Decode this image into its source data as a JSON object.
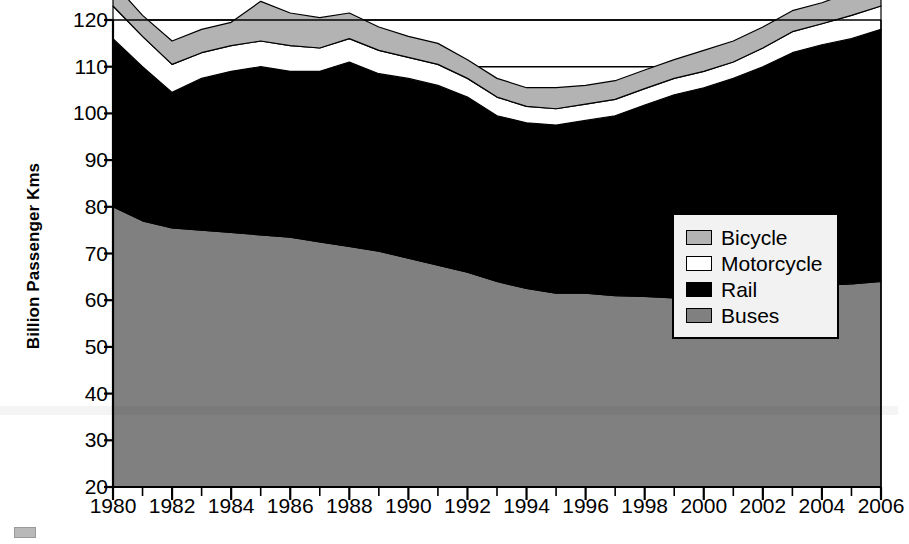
{
  "chart_data": {
    "type": "area",
    "stacked": true,
    "title": "",
    "xlabel": "",
    "ylabel": "Billion Passenger Kms",
    "x": [
      1980,
      1981,
      1982,
      1983,
      1984,
      1985,
      1986,
      1987,
      1988,
      1989,
      1990,
      1991,
      1992,
      1993,
      1994,
      1995,
      1996,
      1997,
      1998,
      1999,
      2000,
      2001,
      2002,
      2003,
      2004,
      2005,
      2006
    ],
    "xlim": [
      1980,
      2006
    ],
    "ylim": [
      20,
      120
    ],
    "ytick_values": [
      20,
      30,
      40,
      50,
      60,
      70,
      80,
      90,
      100,
      110,
      120
    ],
    "ytick_labels": [
      "20",
      "30",
      "40",
      "50",
      "60",
      "70",
      "80",
      "90",
      "100",
      "110",
      "120"
    ],
    "xtick_values": [
      1980,
      1982,
      1984,
      1986,
      1988,
      1990,
      1992,
      1994,
      1996,
      1998,
      2000,
      2002,
      2004,
      2006
    ],
    "xtick_labels": [
      "1980",
      "1982",
      "1984",
      "1986",
      "1988",
      "1990",
      "1992",
      "1994",
      "1996",
      "1998",
      "2000",
      "2002",
      "2004",
      "2006"
    ],
    "xtick_minor_every": 1,
    "gridlines_y": [
      90,
      100,
      110,
      120
    ],
    "grid": true,
    "legend_position": "lower-right inside plot",
    "series": [
      {
        "name": "Buses",
        "color": "#808080",
        "stack_order": 1,
        "values": [
          60.0,
          57.0,
          55.5,
          55.0,
          54.5,
          54.0,
          53.5,
          52.5,
          51.5,
          50.5,
          49.0,
          47.5,
          46.0,
          44.0,
          42.5,
          41.5,
          41.5,
          41.0,
          40.8,
          40.5,
          41.0,
          41.5,
          42.0,
          43.0,
          43.2,
          43.5,
          44.0
        ]
      },
      {
        "name": "Rail",
        "color": "#000000",
        "stack_order": 2,
        "values": [
          36.0,
          33.0,
          29.0,
          32.5,
          34.5,
          36.0,
          35.5,
          36.5,
          39.5,
          38.0,
          38.5,
          38.5,
          37.5,
          35.5,
          35.5,
          36.0,
          37.0,
          38.5,
          41.0,
          43.5,
          44.5,
          46.0,
          48.0,
          50.0,
          51.5,
          52.5,
          54.0
        ]
      },
      {
        "name": "Motorcycle",
        "color": "#ffffff",
        "stack_order": 3,
        "values": [
          7.0,
          6.5,
          6.0,
          5.5,
          5.5,
          5.5,
          5.5,
          5.0,
          5.0,
          5.0,
          4.5,
          4.5,
          4.0,
          4.0,
          3.5,
          3.5,
          3.5,
          3.5,
          3.5,
          3.5,
          3.5,
          3.5,
          4.0,
          4.5,
          4.5,
          5.0,
          5.0
        ]
      },
      {
        "name": "Bicycle",
        "color": "#b3b3b3",
        "stack_order": 4,
        "values": [
          5.0,
          4.5,
          5.0,
          5.0,
          5.0,
          8.5,
          7.0,
          6.5,
          5.5,
          5.0,
          4.5,
          4.5,
          4.0,
          4.0,
          4.0,
          4.5,
          4.0,
          4.0,
          4.0,
          4.0,
          4.5,
          4.5,
          4.5,
          4.5,
          4.5,
          5.0,
          5.0
        ]
      }
    ],
    "totals": [
      108.0,
      101.0,
      95.5,
      98.0,
      99.5,
      104.0,
      101.5,
      100.5,
      101.5,
      98.5,
      96.5,
      95.0,
      91.5,
      87.5,
      85.5,
      85.5,
      86.0,
      87.0,
      89.3,
      91.5,
      93.5,
      95.5,
      98.5,
      102.0,
      103.7,
      106.0,
      108.0
    ]
  },
  "axes": {
    "y_title": "Billion Passenger Kms"
  },
  "legend": {
    "items": [
      {
        "label": "Bicycle",
        "color": "#b3b3b3"
      },
      {
        "label": "Motorcycle",
        "color": "#ffffff"
      },
      {
        "label": "Rail",
        "color": "#000000"
      },
      {
        "label": "Buses",
        "color": "#808080"
      }
    ]
  }
}
